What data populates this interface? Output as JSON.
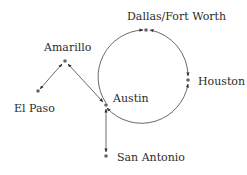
{
  "diagram": {
    "type": "network-routes",
    "colors": {
      "line": "#444444",
      "node": "#666666",
      "text": "#2b2b2b",
      "background": "#ffffff"
    },
    "nodes": [
      {
        "id": "dallas",
        "label": "Dallas/Fort Worth"
      },
      {
        "id": "amarillo",
        "label": "Amarillo"
      },
      {
        "id": "houston",
        "label": "Houston"
      },
      {
        "id": "austin",
        "label": "Austin"
      },
      {
        "id": "el_paso",
        "label": "El Paso"
      },
      {
        "id": "san_antonio",
        "label": "San Antonio"
      }
    ],
    "edges": [
      {
        "from": "amarillo",
        "to": "el_paso",
        "style": "bidirectional"
      },
      {
        "from": "amarillo",
        "to": "austin",
        "style": "bidirectional"
      },
      {
        "from": "austin",
        "to": "san_antonio",
        "style": "bidirectional"
      },
      {
        "from": "austin",
        "to": "dallas",
        "style": "loop-arc"
      },
      {
        "from": "dallas",
        "to": "houston",
        "style": "loop-arc"
      },
      {
        "from": "houston",
        "to": "austin",
        "style": "loop-arc"
      }
    ]
  }
}
